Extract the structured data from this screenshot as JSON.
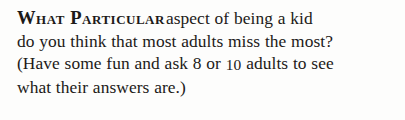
{
  "document": {
    "type": "book-page-excerpt",
    "background_color": "#fdfdfc",
    "text_color": "#1c1a18",
    "passage": {
      "lead_in_smallcaps": "What Particular",
      "lines": [
        {
          "id": "line-1",
          "text": "aspect of being a kid",
          "has_lead_in": true
        },
        {
          "id": "line-2",
          "text": "do you think that most adults miss the most?",
          "has_lead_in": false
        },
        {
          "id": "line-3",
          "text_before_number": "(Have some fun and ask 8 or ",
          "number": "10",
          "text_after_number": " adults to see",
          "has_lead_in": false
        },
        {
          "id": "line-4",
          "text": "what their answers are.)",
          "has_lead_in": false
        }
      ],
      "full_text": "WHAT PARTICULAR aspect of being a kid do you think that most adults miss the most? (Have some fun and ask 8 or 10 adults to see what their answers are.)"
    }
  }
}
